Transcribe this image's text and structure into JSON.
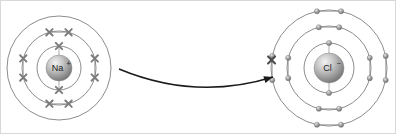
{
  "diagram": {
    "type": "atomic-shell-diagram",
    "background_color": "#ffffff",
    "border_color": "#d8d8d8",
    "width": 396,
    "height": 134
  },
  "atoms": [
    {
      "id": "sodium-ion",
      "label": "Na",
      "charge": "+",
      "full_label": "Na+",
      "center_x": 58,
      "center_y": 67,
      "nucleus_radius": 13,
      "nucleus_color": "#9a9a9a",
      "electron_symbol": "x",
      "electron_color": "#7b7b7b",
      "shells": [
        {
          "index": 1,
          "radius": 22,
          "electron_count": 2,
          "electron_angles": [
            270,
            90
          ]
        },
        {
          "index": 2,
          "radius": 37,
          "electron_count": 8,
          "electron_angles": [
            255,
            285,
            345,
            15,
            75,
            105,
            165,
            195
          ]
        },
        {
          "index": 3,
          "radius": 52,
          "electron_count": 0,
          "electron_angles": []
        }
      ],
      "shell_color": "#6e6e6e"
    },
    {
      "id": "chloride-ion",
      "label": "Cl",
      "charge": "−",
      "full_label": "Cl−",
      "center_x": 328,
      "center_y": 67,
      "nucleus_radius": 15,
      "nucleus_color": "#9a9a9a",
      "electron_symbol": "dot",
      "electron_color": "#8d8d8d",
      "shells": [
        {
          "index": 1,
          "radius": 25,
          "electron_count": 2,
          "electron_angles": [
            270,
            90
          ]
        },
        {
          "index": 2,
          "radius": 42,
          "electron_count": 8,
          "electron_angles": [
            256,
            284,
            346,
            14,
            76,
            104,
            166,
            194
          ]
        },
        {
          "index": 3,
          "radius": 58,
          "electron_count": 8,
          "electron_angles": [
            258,
            282,
            348,
            12,
            78,
            102,
            168,
            192
          ]
        }
      ],
      "shell_color": "#6e6e6e",
      "transferred_electron": {
        "symbol": "x",
        "shell_index": 3,
        "angle": 188,
        "color": "#4a4a4a"
      }
    }
  ],
  "arrow": {
    "name": "electron-transfer-arrow",
    "from_x": 118,
    "from_y": 68,
    "to_x": 272,
    "to_y": 76,
    "control_x": 195,
    "control_y": 100,
    "color": "#1a1a1a",
    "stroke_width": 1.5,
    "head_length": 9
  }
}
